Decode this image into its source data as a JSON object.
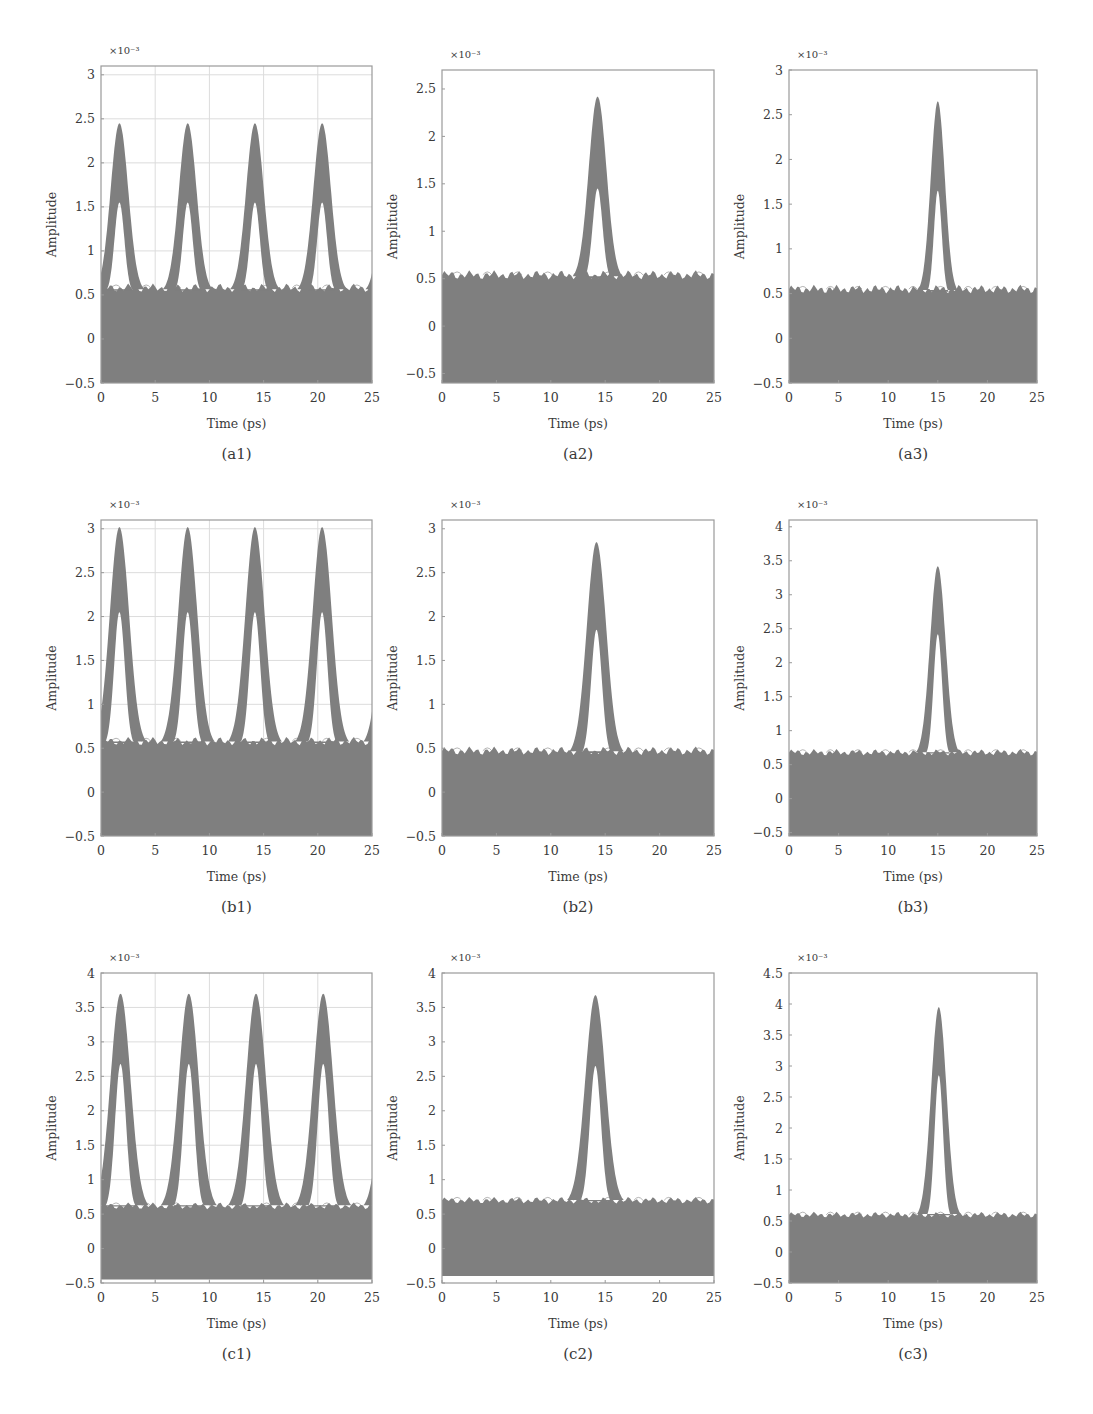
{
  "figure": {
    "background": "#ffffff",
    "trace_color": "#7f7f7f",
    "frame_color": "#9a9a9a",
    "grid_color": "#dcdcdc"
  },
  "chart_data": [
    {
      "id": "a1",
      "type": "area",
      "caption": "(a1)",
      "xlabel": "Time (ps)",
      "ylabel": "Amplitude",
      "y_multiplier": "×10⁻³",
      "xlim": [
        0,
        25
      ],
      "ylim": [
        -0.5,
        3.1
      ],
      "xticks": [
        0,
        5,
        10,
        15,
        20,
        25
      ],
      "yticks": [
        -0.5,
        0,
        0.5,
        1,
        1.5,
        2,
        2.5,
        3
      ],
      "ytick_labels": [
        "−0.5",
        "0",
        "0.5",
        "1",
        "1.5",
        "2",
        "2.5",
        "3"
      ],
      "grid": true,
      "frame": {
        "x0": 101,
        "x1": 372,
        "y0": 66,
        "y1": 383
      },
      "noise_floor": 0.58,
      "noise_bottom": -0.5,
      "pulses": [
        {
          "center": 1.7,
          "peak": 2.45,
          "inner_peak": 1.55,
          "half_width": 2.3
        },
        {
          "center": 8.0,
          "peak": 2.45,
          "inner_peak": 1.55,
          "half_width": 2.3
        },
        {
          "center": 14.2,
          "peak": 2.45,
          "inner_peak": 1.55,
          "half_width": 2.3
        },
        {
          "center": 20.4,
          "peak": 2.45,
          "inner_peak": 1.55,
          "half_width": 2.3
        }
      ],
      "edge_rise": {
        "left_start": 1.1,
        "right_end": 0.95
      }
    },
    {
      "id": "a2",
      "type": "area",
      "caption": "(a2)",
      "xlabel": "Time (ps)",
      "ylabel": "Amplitude",
      "y_multiplier": "×10⁻³",
      "xlim": [
        0,
        25
      ],
      "ylim": [
        -0.6,
        2.7
      ],
      "xticks": [
        0,
        5,
        10,
        15,
        20,
        25
      ],
      "yticks": [
        -0.5,
        0,
        0.5,
        1,
        1.5,
        2,
        2.5
      ],
      "ytick_labels": [
        "−0.5",
        "0",
        "0.5",
        "1",
        "1.5",
        "2",
        "2.5"
      ],
      "grid": false,
      "frame": {
        "x0": 442,
        "x1": 714,
        "y0": 70,
        "y1": 383
      },
      "noise_floor": 0.54,
      "noise_bottom": -0.6,
      "pulses": [
        {
          "center": 14.3,
          "peak": 2.42,
          "inner_peak": 1.45,
          "half_width": 2.3
        }
      ],
      "edge_rise": null
    },
    {
      "id": "a3",
      "type": "area",
      "caption": "(a3)",
      "xlabel": "Time (ps)",
      "ylabel": "Amplitude",
      "y_multiplier": "×10⁻³",
      "xlim": [
        0,
        25
      ],
      "ylim": [
        -0.5,
        3.0
      ],
      "xticks": [
        0,
        5,
        10,
        15,
        20,
        25
      ],
      "yticks": [
        -0.5,
        0,
        0.5,
        1,
        1.5,
        2,
        2.5,
        3
      ],
      "ytick_labels": [
        "−0.5",
        "0",
        "0.5",
        "1",
        "1.5",
        "2",
        "2.5",
        "3"
      ],
      "grid": false,
      "frame": {
        "x0": 789,
        "x1": 1037,
        "y0": 70,
        "y1": 383
      },
      "noise_floor": 0.55,
      "noise_bottom": -0.5,
      "pulses": [
        {
          "center": 15.0,
          "peak": 2.65,
          "inner_peak": 1.65,
          "half_width": 2.0
        }
      ],
      "edge_rise": null
    },
    {
      "id": "b1",
      "type": "area",
      "caption": "(b1)",
      "xlabel": "Time (ps)",
      "ylabel": "Amplitude",
      "y_multiplier": "×10⁻³",
      "xlim": [
        0,
        25
      ],
      "ylim": [
        -0.5,
        3.1
      ],
      "xticks": [
        0,
        5,
        10,
        15,
        20,
        25
      ],
      "yticks": [
        -0.5,
        0,
        0.5,
        1,
        1.5,
        2,
        2.5,
        3
      ],
      "ytick_labels": [
        "−0.5",
        "0",
        "0.5",
        "1",
        "1.5",
        "2",
        "2.5",
        "3"
      ],
      "grid": true,
      "frame": {
        "x0": 101,
        "x1": 372,
        "y0": 520,
        "y1": 836
      },
      "noise_floor": 0.58,
      "noise_bottom": -0.5,
      "pulses": [
        {
          "center": 1.7,
          "peak": 3.02,
          "inner_peak": 2.05,
          "half_width": 2.5
        },
        {
          "center": 8.0,
          "peak": 3.02,
          "inner_peak": 2.05,
          "half_width": 2.5
        },
        {
          "center": 14.2,
          "peak": 3.02,
          "inner_peak": 2.05,
          "half_width": 2.5
        },
        {
          "center": 20.4,
          "peak": 3.02,
          "inner_peak": 2.05,
          "half_width": 2.5
        }
      ],
      "edge_rise": {
        "left_start": 1.4,
        "right_end": 1.25
      }
    },
    {
      "id": "b2",
      "type": "area",
      "caption": "(b2)",
      "xlabel": "Time (ps)",
      "ylabel": "Amplitude",
      "y_multiplier": "×10⁻³",
      "xlim": [
        0,
        25
      ],
      "ylim": [
        -0.5,
        3.1
      ],
      "xticks": [
        0,
        5,
        10,
        15,
        20,
        25
      ],
      "yticks": [
        -0.5,
        0,
        0.5,
        1,
        1.5,
        2,
        2.5,
        3
      ],
      "ytick_labels": [
        "−0.5",
        "0",
        "0.5",
        "1",
        "1.5",
        "2",
        "2.5",
        "3"
      ],
      "grid": false,
      "frame": {
        "x0": 442,
        "x1": 714,
        "y0": 520,
        "y1": 836
      },
      "noise_floor": 0.47,
      "noise_bottom": -0.5,
      "pulses": [
        {
          "center": 14.2,
          "peak": 2.85,
          "inner_peak": 1.85,
          "half_width": 2.5
        }
      ],
      "edge_rise": null
    },
    {
      "id": "b3",
      "type": "area",
      "caption": "(b3)",
      "xlabel": "Time (ps)",
      "ylabel": "Amplitude",
      "y_multiplier": "×10⁻³",
      "xlim": [
        0,
        25
      ],
      "ylim": [
        -0.55,
        4.1
      ],
      "xticks": [
        0,
        5,
        10,
        15,
        20,
        25
      ],
      "yticks": [
        -0.5,
        0,
        0.5,
        1,
        1.5,
        2,
        2.5,
        3,
        3.5,
        4
      ],
      "ytick_labels": [
        "−0.5",
        "0",
        "0.5",
        "1",
        "1.5",
        "2",
        "2.5",
        "3",
        "3.5",
        "4"
      ],
      "grid": false,
      "frame": {
        "x0": 789,
        "x1": 1037,
        "y0": 520,
        "y1": 836
      },
      "noise_floor": 0.68,
      "noise_bottom": -0.55,
      "pulses": [
        {
          "center": 15.0,
          "peak": 3.42,
          "inner_peak": 2.42,
          "half_width": 2.2
        }
      ],
      "edge_rise": null
    },
    {
      "id": "c1",
      "type": "area",
      "caption": "(c1)",
      "xlabel": "Time (ps)",
      "ylabel": "Amplitude",
      "y_multiplier": "×10⁻³",
      "xlim": [
        0,
        25
      ],
      "ylim": [
        -0.5,
        4.0
      ],
      "xticks": [
        0,
        5,
        10,
        15,
        20,
        25
      ],
      "yticks": [
        -0.5,
        0,
        0.5,
        1,
        1.5,
        2,
        2.5,
        3,
        3.5,
        4
      ],
      "ytick_labels": [
        "−0.5",
        "0",
        "0.5",
        "1",
        "1.5",
        "2",
        "2.5",
        "3",
        "3.5",
        "4"
      ],
      "grid": true,
      "frame": {
        "x0": 101,
        "x1": 372,
        "y0": 973,
        "y1": 1283
      },
      "noise_floor": 0.62,
      "noise_bottom": -0.45,
      "pulses": [
        {
          "center": 1.8,
          "peak": 3.7,
          "inner_peak": 2.68,
          "half_width": 2.6
        },
        {
          "center": 8.1,
          "peak": 3.7,
          "inner_peak": 2.68,
          "half_width": 2.6
        },
        {
          "center": 14.3,
          "peak": 3.7,
          "inner_peak": 2.68,
          "half_width": 2.6
        },
        {
          "center": 20.5,
          "peak": 3.7,
          "inner_peak": 2.68,
          "half_width": 2.6
        }
      ],
      "edge_rise": {
        "left_start": 1.5,
        "right_end": 1.3
      }
    },
    {
      "id": "c2",
      "type": "area",
      "caption": "(c2)",
      "xlabel": "Time (ps)",
      "ylabel": "Amplitude",
      "y_multiplier": "×10⁻³",
      "xlim": [
        0,
        25
      ],
      "ylim": [
        -0.5,
        4.0
      ],
      "xticks": [
        0,
        5,
        10,
        15,
        20,
        25
      ],
      "yticks": [
        -0.5,
        0,
        0.5,
        1,
        1.5,
        2,
        2.5,
        3,
        3.5,
        4
      ],
      "ytick_labels": [
        "−0.5",
        "0",
        "0.5",
        "1",
        "1.5",
        "2",
        "2.5",
        "3",
        "3.5",
        "4"
      ],
      "grid": false,
      "frame": {
        "x0": 442,
        "x1": 714,
        "y0": 973,
        "y1": 1283
      },
      "noise_floor": 0.7,
      "noise_bottom": -0.4,
      "pulses": [
        {
          "center": 14.1,
          "peak": 3.68,
          "inner_peak": 2.65,
          "half_width": 2.6
        }
      ],
      "edge_rise": null
    },
    {
      "id": "c3",
      "type": "area",
      "caption": "(c3)",
      "xlabel": "Time (ps)",
      "ylabel": "Amplitude",
      "y_multiplier": "×10⁻³",
      "xlim": [
        0,
        25
      ],
      "ylim": [
        -0.5,
        4.5
      ],
      "xticks": [
        0,
        5,
        10,
        15,
        20,
        25
      ],
      "yticks": [
        -0.5,
        0,
        0.5,
        1,
        1.5,
        2,
        2.5,
        3,
        3.5,
        4,
        4.5
      ],
      "ytick_labels": [
        "−0.5",
        "0",
        "0.5",
        "1",
        "1.5",
        "2",
        "2.5",
        "3",
        "3.5",
        "4",
        "4.5"
      ],
      "grid": false,
      "frame": {
        "x0": 789,
        "x1": 1037,
        "y0": 973,
        "y1": 1283
      },
      "noise_floor": 0.6,
      "noise_bottom": -0.5,
      "pulses": [
        {
          "center": 15.1,
          "peak": 3.95,
          "inner_peak": 2.85,
          "half_width": 2.2
        }
      ],
      "edge_rise": null
    }
  ]
}
